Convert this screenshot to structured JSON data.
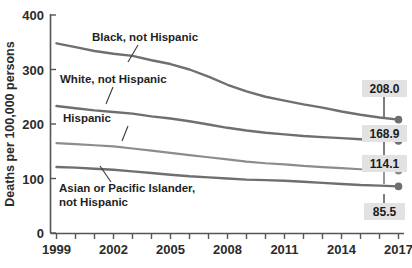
{
  "chart_data": {
    "type": "line",
    "title": "",
    "xlabel": "",
    "ylabel": "Deaths per 100,000 persons",
    "ylim": [
      0,
      400
    ],
    "ytick_labels": [
      "0",
      "100",
      "200",
      "300",
      "400"
    ],
    "ytick_values": [
      0,
      100,
      200,
      300,
      400
    ],
    "xlim": [
      1999,
      2017
    ],
    "xtick_labels": [
      "1999",
      "2002",
      "2005",
      "2008",
      "2011",
      "2014",
      "2017"
    ],
    "xtick_values": [
      1999,
      2002,
      2005,
      2008,
      2011,
      2014,
      2017
    ],
    "x": [
      1999,
      2000,
      2001,
      2002,
      2003,
      2004,
      2005,
      2006,
      2007,
      2008,
      2009,
      2010,
      2011,
      2012,
      2013,
      2014,
      2015,
      2016,
      2017
    ],
    "grid": false,
    "legend_position": "inline-annotations",
    "line_color": "#6f6f6f",
    "marker_color": "#6f6f6f",
    "label_box_color": "#e2e2e2",
    "series": [
      {
        "name": "Black, not Hispanic",
        "end_label": "208.0",
        "values": [
          348,
          341,
          334,
          329,
          325,
          317,
          310,
          300,
          287,
          272,
          260,
          250,
          243,
          236,
          230,
          223,
          217,
          212,
          208.0
        ]
      },
      {
        "name": "White, not Hispanic",
        "end_label": "168.9",
        "values": [
          233,
          229,
          225,
          222,
          219,
          214,
          210,
          205,
          199,
          193,
          188,
          184,
          181,
          178,
          176,
          174,
          172,
          170,
          168.9
        ]
      },
      {
        "name": "Hispanic",
        "end_label": "114.1",
        "values": [
          165,
          163,
          161,
          159,
          155,
          151,
          147,
          143,
          139,
          135,
          131,
          128,
          126,
          123,
          121,
          119,
          117,
          115,
          114.1
        ]
      },
      {
        "name": "Asian or Pacific Islander, not Hispanic",
        "end_label": "85.5",
        "values": [
          121,
          120,
          118,
          116,
          113,
          110,
          107,
          104,
          102,
          100,
          98,
          97,
          96,
          94,
          92,
          90,
          88,
          87,
          85.5
        ]
      }
    ],
    "annotations": [
      {
        "text": "Black, not Hispanic",
        "lines": [
          "Black, not Hispanic"
        ]
      },
      {
        "text": "White, not Hispanic",
        "lines": [
          "White, not Hispanic"
        ]
      },
      {
        "text": "Hispanic",
        "lines": [
          "Hispanic"
        ]
      },
      {
        "text": "Asian or Pacific Islander, not Hispanic",
        "lines": [
          "Asian or Pacific Islander,",
          "not Hispanic"
        ]
      }
    ]
  }
}
